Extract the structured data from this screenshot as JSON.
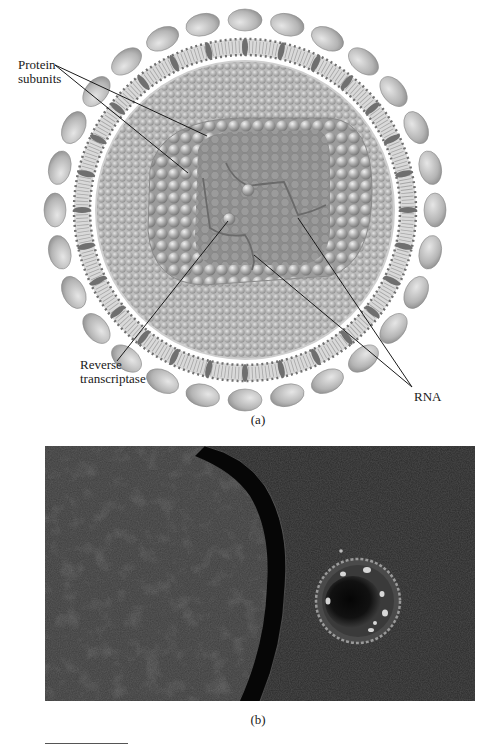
{
  "figure": {
    "panel_a": {
      "caption": "(a)",
      "title": "Retrovirus structure diagram",
      "labels": {
        "protein_subunits": [
          "Protein",
          "subunits"
        ],
        "reverse_transcriptase": [
          "Reverse",
          "transcriptase"
        ],
        "rna": "RNA"
      }
    },
    "panel_b": {
      "caption": "(b)",
      "title": "Electron micrograph of virus particle next to cell"
    },
    "colors": {
      "background": "#ffffff",
      "envelope_glycoprotein": "#b8b8b8",
      "membrane": "#8a8a8a",
      "capsid": "#a8a8a8",
      "core": "#8c8c8c",
      "micrograph_bg": "#2b2b2b"
    }
  }
}
